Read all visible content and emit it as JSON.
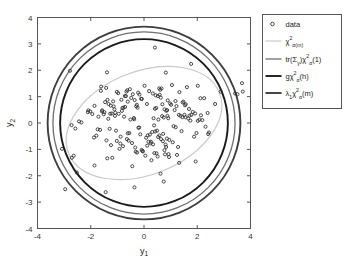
{
  "figure": {
    "background_color": "#ffffff",
    "axes_color": "#555555"
  },
  "axes": {
    "xlabel_base": "y",
    "xlabel_sub": "1",
    "ylabel_base": "y",
    "ylabel_sub": "2",
    "xlim": [
      -4,
      4
    ],
    "ylim": [
      -4,
      4
    ],
    "xticks": [
      -4,
      -2,
      0,
      2,
      4
    ],
    "xtick_labels": [
      "-4",
      "-2",
      "0",
      "2",
      "4"
    ],
    "yticks": [
      -4,
      -3,
      -2,
      -1,
      0,
      1,
      2,
      3,
      4
    ],
    "ytick_labels": [
      "-4",
      "-3",
      "-2",
      "-1",
      "0",
      "1",
      "2",
      "3",
      "4"
    ],
    "grid": false
  },
  "legend": {
    "position": "outside-right-top",
    "items": [
      {
        "name": "data",
        "glyph": "marker-circle",
        "label_plain": "data",
        "color": "#2a2a2a",
        "parts": [
          {
            "t": "data",
            "k": "base"
          }
        ]
      },
      {
        "name": "chi2-alpha-m",
        "glyph": "line",
        "label_plain": "chi^2_{alpha(m)}",
        "color": "#c9c9c9",
        "linewidth": 1.2,
        "parts": [
          {
            "t": "χ",
            "k": "base"
          },
          {
            "t": "2",
            "k": "sup"
          },
          {
            "t": "α(m)",
            "k": "sub"
          }
        ]
      },
      {
        "name": "tr-sigma-y-chi2-alpha-1",
        "glyph": "line",
        "label_plain": "tr(Sigma_y)chi^2_alpha(1)",
        "color": "#6e6e6e",
        "linewidth": 1.3,
        "parts": [
          {
            "t": "tr(Σ",
            "k": "base"
          },
          {
            "t": "y",
            "k": "sub"
          },
          {
            "t": ")χ",
            "k": "base"
          },
          {
            "t": "2",
            "k": "sup"
          },
          {
            "t": "α",
            "k": "sub"
          },
          {
            "t": "(1)",
            "k": "base"
          }
        ]
      },
      {
        "name": "g-chi2-alpha-h",
        "glyph": "line",
        "label_plain": "g chi^2_alpha(h)",
        "color": "#1a1a1a",
        "linewidth": 1.9,
        "parts": [
          {
            "t": "gχ",
            "k": "base"
          },
          {
            "t": "2",
            "k": "sup"
          },
          {
            "t": "α",
            "k": "sub"
          },
          {
            "t": "(h)",
            "k": "base"
          }
        ]
      },
      {
        "name": "lambda1-chi2-alpha-m",
        "glyph": "line",
        "label_plain": "lambda_1 chi^2_alpha(m)",
        "color": "#3d3d3d",
        "linewidth": 1.9,
        "parts": [
          {
            "t": "λ",
            "k": "base"
          },
          {
            "t": "1",
            "k": "sub"
          },
          {
            "t": "χ",
            "k": "base"
          },
          {
            "t": "2",
            "k": "sup"
          },
          {
            "t": "α",
            "k": "sub"
          },
          {
            "t": "(m)",
            "k": "base"
          }
        ]
      }
    ]
  },
  "chart_data": {
    "type": "scatter",
    "title": "",
    "xlabel": "y_1",
    "ylabel": "y_2",
    "xlim": [
      -4,
      4
    ],
    "ylim": [
      -4,
      4
    ],
    "grid": false,
    "legend_position": "outside right top",
    "series": [
      {
        "name": "data",
        "type": "scatter",
        "marker": "o",
        "n_points": 207,
        "x": [
          -0.37,
          0.42,
          -1.37,
          -0.64,
          0.88,
          1.69,
          -1.24,
          0.33,
          -0.21,
          1.02,
          -2.11,
          0.77,
          -0.95,
          1.44,
          -0.08,
          0.58,
          -1.61,
          2.02,
          -0.45,
          0.19,
          -1.05,
          1.22,
          -0.72,
          0.05,
          -1.88,
          0.91,
          -0.33,
          1.57,
          -2.35,
          0.66,
          -0.55,
          1.11,
          -1.46,
          0.28,
          0.84,
          -0.17,
          1.78,
          -1.02,
          0.47,
          -0.81,
          2.26,
          -1.71,
          0.12,
          1.33,
          -0.29,
          0.72,
          -1.19,
          1.92,
          -0.61,
          0.38,
          -2.58,
          1.05,
          -0.88,
          0.54,
          -1.33,
          2.14,
          -0.04,
          0.95,
          -1.57,
          0.61,
          1.41,
          -0.48,
          0.25,
          -1.94,
          0.79,
          -0.71,
          1.66,
          -0.14,
          0.44,
          -1.11,
          2.39,
          -0.92,
          0.68,
          -1.42,
          1.19,
          -0.35,
          0.86,
          -2.02,
          0.51,
          1.74,
          -0.66,
          0.31,
          -1.25,
          1.48,
          -0.09,
          0.74,
          -1.79,
          2.08,
          -0.53,
          0.17,
          -1.08,
          1.28,
          -0.77,
          0.02,
          -1.65,
          0.98,
          -0.26,
          1.52,
          -2.44,
          0.63,
          -0.58,
          1.15,
          -1.38,
          0.36,
          0.81,
          -0.22,
          1.83,
          -1.14,
          0.49,
          -0.85,
          2.31,
          -1.62,
          0.08,
          1.37,
          -0.31,
          0.69,
          -1.27,
          1.97,
          -0.68,
          0.41,
          -2.72,
          1.08,
          -0.83,
          0.57,
          -1.29,
          2.19,
          -0.11,
          0.92,
          -1.51,
          0.64,
          1.45,
          -0.42,
          0.22,
          -1.86,
          0.83,
          -0.75,
          1.61,
          -0.18,
          0.46,
          -1.16,
          2.44,
          -0.97,
          0.71,
          -1.49,
          1.24,
          -0.38,
          0.89,
          -2.09,
          0.53,
          1.71,
          -0.63,
          0.34,
          -1.21,
          1.54,
          -0.06,
          0.77,
          -1.74,
          2.12,
          -0.51,
          0.14,
          -1.02,
          1.31,
          -0.79,
          0.11,
          -1.58,
          0.94,
          -0.24,
          1.56,
          -1.41,
          0.59,
          -0.61,
          1.18,
          -1.34,
          0.39,
          0.87,
          -0.27,
          1.88,
          -1.09,
          0.52,
          -0.89,
          3.68,
          3.71,
          -3.08,
          -2.96,
          -2.71,
          -2.64,
          -1.44,
          -0.36,
          0.41,
          0.74,
          1.77,
          2.02,
          2.88,
          3.42,
          3.51,
          -2.78,
          -1.39,
          0.82,
          1.94,
          -2.52,
          0.62,
          -1.86,
          2.41,
          1.32,
          -0.44,
          2.67,
          0.26
        ],
        "y": [
          0.14,
          -0.32,
          0.88,
          -0.61,
          0.27,
          0.53,
          -0.84,
          1.12,
          -0.18,
          0.69,
          0.41,
          -1.03,
          0.35,
          0.22,
          0.91,
          -0.47,
          1.38,
          0.08,
          -0.76,
          1.21,
          -0.29,
          0.64,
          1.02,
          -1.24,
          -0.55,
          0.18,
          -0.93,
          0.71,
          0.02,
          1.31,
          -0.38,
          -0.12,
          0.79,
          -1.41,
          0.46,
          1.08,
          0.31,
          -0.68,
          -1.15,
          0.57,
          0.94,
          0.24,
          -0.86,
          1.17,
          0.63,
          -0.41,
          -1.32,
          0.36,
          0.81,
          -0.09,
          -0.21,
          1.44,
          -0.52,
          0.13,
          0.72,
          0.29,
          -1.08,
          -0.64,
          0.48,
          1.26,
          -0.31,
          0.95,
          -0.77,
          0.34,
          -1.19,
          0.61,
          0.17,
          -0.43,
          1.05,
          0.52,
          0.38,
          -0.98,
          0.26,
          1.33,
          -0.16,
          0.87,
          -0.59,
          0.44,
          -1.27,
          0.09,
          1.19,
          -0.34,
          0.66,
          0.81,
          -1.02,
          0.21,
          -0.48,
          0.12,
          1.28,
          -0.71,
          0.39,
          -0.91,
          0.58,
          1.41,
          -0.26,
          0.74,
          -1.12,
          0.31,
          0.06,
          0.96,
          -0.67,
          0.49,
          -1.34,
          0.18,
          -0.82,
          1.15,
          0.42,
          0.63,
          -0.29,
          0.88,
          -0.14,
          1.22,
          -0.56,
          0.27,
          -1.09,
          0.71,
          0.35,
          -0.38,
          1.02,
          0.54,
          -0.08,
          -0.73,
          0.46,
          1.31,
          -0.22,
          0.11,
          0.92,
          -1.18,
          0.33,
          -0.61,
          0.78,
          1.09,
          -0.44,
          0.65,
          -0.91,
          0.24,
          1.36,
          -0.17,
          0.57,
          0.82,
          -0.36,
          1.13,
          -0.69,
          0.41,
          -1.21,
          0.19,
          0.86,
          0.48,
          -0.53,
          0.28,
          1.24,
          -0.81,
          0.36,
          0.67,
          -1.06,
          0.52,
          -0.24,
          0.94,
          0.13,
          -0.47,
          1.18,
          0.31,
          -0.88,
          0.72,
          0.44,
          -1.29,
          0.58,
          0.22,
          -0.66,
          1.07,
          -0.39,
          0.83,
          0.16,
          -1.14,
          0.49,
          0.69,
          -0.52,
          0.27,
          1.02,
          -0.78,
          1.51,
          1.19,
          -0.98,
          -2.51,
          -1.32,
          -1.24,
          -2.62,
          -2.44,
          2.86,
          -2.22,
          2.24,
          1.41,
          1.19,
          1.12,
          1.09,
          1.98,
          1.92,
          1.91,
          -1.46,
          -1.88,
          -1.92,
          -1.61,
          -0.42,
          -1.51,
          -1.64,
          0.72,
          -0.71
        ]
      },
      {
        "name": "chi2_alpha(m)",
        "type": "ellipse",
        "center": [
          0.0,
          0.0
        ],
        "semi_major": 3.05,
        "semi_minor": 1.95,
        "rotation_deg": 22,
        "color": "#c9c9c9",
        "linewidth": 1.2
      },
      {
        "name": "tr(Sigma_y)chi2_alpha(1)",
        "type": "circle",
        "center": [
          0.0,
          0.0
        ],
        "radius": 3.42,
        "color": "#6e6e6e",
        "linewidth": 1.3
      },
      {
        "name": "g chi2_alpha(h)",
        "type": "circle",
        "center": [
          0.0,
          0.0
        ],
        "radius": 3.15,
        "color": "#1a1a1a",
        "linewidth": 1.9
      },
      {
        "name": "lambda_1 chi2_alpha(m)",
        "type": "circle",
        "center": [
          0.0,
          0.0
        ],
        "radius": 3.62,
        "color": "#3d3d3d",
        "linewidth": 1.9
      }
    ]
  }
}
